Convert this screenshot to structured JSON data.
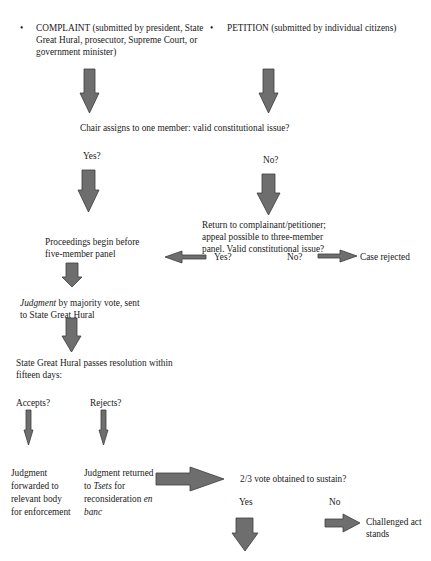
{
  "diagram": {
    "type": "flowchart",
    "arrow_color": "#6e6e6e",
    "arrow_stroke": "#3c3c3c",
    "nodes": {
      "complaint_bullet": "•",
      "complaint": "COMPLAINT (submitted by president, State Great Hural, prosecutor, Supreme Court, or government minister)",
      "petition_bullet": "•",
      "petition": "PETITION (submitted by individual citizens)",
      "chair_assigns": "Chair assigns to one member: valid constitutional issue?",
      "yes_1": "Yes?",
      "no_1": "No?",
      "return_to": "Return to complainant/petitioner; appeal possible to three-member panel. Valid constitutional issue?",
      "yes_2": "Yes?",
      "no_2": "No?",
      "case_rejected": "Case rejected",
      "proceedings": "Proceedings begin before five-member panel",
      "judgment_italic": "Judgment",
      "judgment_rest": " by majority vote, sent to State Great Hural",
      "sgh_resolution": "State Great Hural passes resolution within fifteen days:",
      "accepts": "Accepts?",
      "rejects": "Rejects?",
      "forwarded": "Judgment forwarded to relevant body for enforcement",
      "returned_1": "Judgment returned to ",
      "returned_tsets": "Tsets",
      "returned_2": " for reconsideration ",
      "returned_enbanc": "en banc",
      "two_thirds": "2/3 vote obtained to sustain?",
      "yes_3": "Yes",
      "no_3": "No",
      "challenged": "Challenged act stands"
    },
    "edges": [
      {
        "from": "complaint",
        "to": "chair_assigns"
      },
      {
        "from": "petition",
        "to": "chair_assigns"
      },
      {
        "from": "chair_assigns",
        "to": "proceedings",
        "label": "Yes?"
      },
      {
        "from": "chair_assigns",
        "to": "return_to",
        "label": "No?"
      },
      {
        "from": "return_to",
        "to": "proceedings",
        "label": "Yes?"
      },
      {
        "from": "return_to",
        "to": "case_rejected",
        "label": "No?"
      },
      {
        "from": "proceedings",
        "to": "judgment"
      },
      {
        "from": "judgment",
        "to": "sgh_resolution"
      },
      {
        "from": "sgh_resolution",
        "to": "forwarded",
        "label": "Accepts?"
      },
      {
        "from": "sgh_resolution",
        "to": "returned",
        "label": "Rejects?"
      },
      {
        "from": "returned",
        "to": "two_thirds"
      },
      {
        "from": "two_thirds",
        "to": "(continues below)",
        "label": "Yes"
      },
      {
        "from": "two_thirds",
        "to": "challenged",
        "label": "No"
      }
    ]
  }
}
